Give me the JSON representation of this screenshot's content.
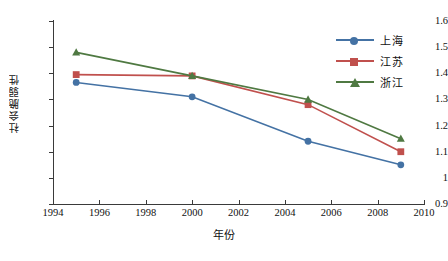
{
  "chart_data": {
    "type": "line",
    "title": "",
    "xlabel": "年份",
    "ylabel": "社会脆弱性",
    "xlim": [
      1994,
      2010
    ],
    "ylim": [
      0.9,
      1.6
    ],
    "grid": false,
    "legend_position": "top-right",
    "x": [
      1995,
      2000,
      2005,
      2009
    ],
    "xticks": [
      1994,
      1996,
      1998,
      2000,
      2002,
      2004,
      2006,
      2008,
      2010
    ],
    "xtick_labels": [
      "1994",
      "1996",
      "1998",
      "2000",
      "2002",
      "2004",
      "2006",
      "2008",
      "2010"
    ],
    "yticks": [
      0.9,
      1.0,
      1.1,
      1.2,
      1.3,
      1.4,
      1.5,
      1.6
    ],
    "ytick_labels": [
      "0.9",
      "1",
      "1.1",
      "1.2",
      "1.3",
      "1.4",
      "1.5",
      "1.6"
    ],
    "series": [
      {
        "name": "上海",
        "color": "#4472A4",
        "marker": "circle",
        "values": [
          1.365,
          1.31,
          1.14,
          1.05
        ]
      },
      {
        "name": "江苏",
        "color": "#C0504D",
        "marker": "square",
        "values": [
          1.395,
          1.39,
          1.28,
          1.1
        ]
      },
      {
        "name": "浙江",
        "color": "#4F7942",
        "marker": "triangle",
        "values": [
          1.48,
          1.39,
          1.3,
          1.15
        ]
      }
    ]
  },
  "axis": {
    "x_title": "年份",
    "y_title": "社会脆弱性"
  },
  "legend": {
    "entries": [
      {
        "label": "上海",
        "color": "#4472A4",
        "marker": "circle"
      },
      {
        "label": "江苏",
        "color": "#C0504D",
        "marker": "square"
      },
      {
        "label": "浙江",
        "color": "#4F7942",
        "marker": "triangle"
      }
    ]
  }
}
